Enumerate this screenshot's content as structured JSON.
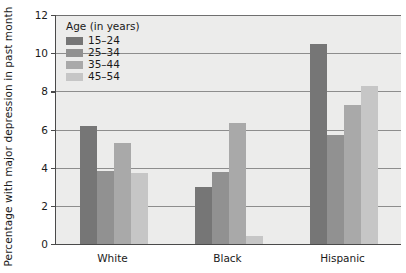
{
  "chart_data": {
    "type": "bar",
    "title": "",
    "xlabel": "",
    "ylabel": "Percentage with major depression in past month",
    "categories": [
      "White",
      "Black",
      "Hispanic"
    ],
    "series": [
      {
        "name": "15–24",
        "color": "#767676",
        "values": [
          6.2,
          3.0,
          10.5
        ]
      },
      {
        "name": "25–34",
        "color": "#919191",
        "values": [
          3.8,
          3.75,
          5.7
        ]
      },
      {
        "name": "35–44",
        "color": "#a9a9a9",
        "values": [
          5.3,
          6.35,
          7.3
        ]
      },
      {
        "name": "45–54",
        "color": "#c6c6c6",
        "values": [
          3.7,
          0.4,
          8.3
        ]
      }
    ],
    "ylim": [
      0,
      12
    ],
    "yticks": [
      0,
      2,
      4,
      6,
      8,
      10,
      12
    ],
    "ytick_labels": [
      "0",
      "2",
      "4",
      "6",
      "8",
      "10",
      "12"
    ],
    "grid": true,
    "legend": {
      "title": "Age (in years)",
      "position": "top-left-inside",
      "entries": [
        "15–24",
        "25–34",
        "35–44",
        "45–54"
      ]
    },
    "plot_background": "#ececeb",
    "gridline_color": "#8d8d8d",
    "axis_color": "#4a4a4a"
  }
}
